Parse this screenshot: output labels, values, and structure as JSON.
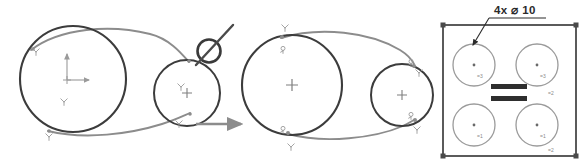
{
  "figure": {
    "background_color": "#ffffff",
    "width": 586,
    "height": 166
  },
  "colors": {
    "circle_stroke": "#3c3c3c",
    "belt_stroke": "#8c8c8c",
    "glyph": "#9a9a9a",
    "panel_stroke": "#4a4a4a",
    "panel_circle_stroke": "#9b9b9b",
    "bar_fill": "#2e2e2e",
    "dimension_text": "#2b2b2b",
    "arrow": "#8c8c8c",
    "constraint_symbol": "#3a3a3a"
  },
  "left_sketch": {
    "name": "unconstrained-pulley-sketch",
    "big_pulley": {
      "cx": 73,
      "cy": 79,
      "r": 53,
      "center_marker": "origin-axes"
    },
    "small_pulley": {
      "cx": 187,
      "cy": 93,
      "r": 33,
      "center_marker": "plus"
    },
    "origin": {
      "x_axis_label": "X",
      "y_axis_label": "Y",
      "marker": "origin-cross"
    },
    "tangent_glyphs": [
      {
        "x": 36,
        "y": 52,
        "type": "tangent-glyph"
      },
      {
        "x": 48,
        "y": 133,
        "type": "tangent-glyph"
      },
      {
        "x": 180,
        "y": 86,
        "type": "tangent-glyph"
      },
      {
        "x": 178,
        "y": 124,
        "type": "tangent-glyph"
      },
      {
        "x": 64,
        "y": 100,
        "type": "tangent-glyph"
      }
    ],
    "belt_segments": 2
  },
  "constraint_symbol": {
    "name": "tangent-constraint-symbol",
    "description": "circle with diagonal line",
    "cx": 209,
    "cy": 50,
    "r": 12
  },
  "transition_arrow": {
    "name": "transition-arrow",
    "direction": "right",
    "x1": 196,
    "y1": 124,
    "x2": 243,
    "y2": 124
  },
  "right_sketch": {
    "name": "constrained-pulley-sketch",
    "big_pulley": {
      "cx": 292,
      "cy": 85,
      "r": 50,
      "center_marker": "plus"
    },
    "small_pulley": {
      "cx": 402,
      "cy": 95,
      "r": 31,
      "center_marker": "plus"
    },
    "tangent_glyphs": [
      {
        "x": 286,
        "y": 30,
        "type": "tangent-glyph"
      },
      {
        "x": 292,
        "y": 146,
        "type": "tangent-glyph"
      },
      {
        "x": 422,
        "y": 68,
        "type": "tangent-glyph"
      },
      {
        "x": 418,
        "y": 128,
        "type": "tangent-glyph"
      }
    ],
    "coincident_glyphs": [
      {
        "x": 283,
        "y": 48,
        "type": "coincident-glyph"
      },
      {
        "x": 283,
        "y": 133,
        "type": "coincident-glyph"
      },
      {
        "x": 412,
        "y": 67,
        "type": "coincident-glyph"
      },
      {
        "x": 412,
        "y": 118,
        "type": "coincident-glyph"
      }
    ],
    "belt_segments": 2
  },
  "hole_pattern_panel": {
    "name": "hole-pattern-panel",
    "dimension_callout": {
      "text": "4x ⌀ 10",
      "quantity_prefix": "4x",
      "diameter_symbol": "⌀",
      "value": "10",
      "leader_from": {
        "x": 498,
        "y": 22
      },
      "leader_to": {
        "x": 473,
        "y": 44
      }
    },
    "plate": {
      "x": 443,
      "y": 25,
      "width": 133,
      "height": 131
    },
    "holes": [
      {
        "id": "hole-top-left",
        "cx": 474,
        "cy": 65,
        "r": 21,
        "label": "=3"
      },
      {
        "id": "hole-top-right",
        "cx": 537,
        "cy": 65,
        "r": 21,
        "label": "=3"
      },
      {
        "id": "hole-bottom-left",
        "cx": 474,
        "cy": 125,
        "r": 21,
        "label": "=1"
      },
      {
        "id": "hole-bottom-right",
        "cx": 537,
        "cy": 125,
        "r": 21,
        "label": "=1"
      }
    ],
    "extra_labels": [
      {
        "id": "label-right-upper",
        "x": 549,
        "y": 94,
        "text": "=2"
      },
      {
        "id": "label-right-lower",
        "x": 549,
        "y": 152,
        "text": "=2"
      }
    ],
    "equal_bars": [
      {
        "id": "equal-bar-upper",
        "x": 491,
        "y": 84,
        "width": 36,
        "height": 5
      },
      {
        "id": "equal-bar-lower",
        "x": 491,
        "y": 96,
        "width": 36,
        "height": 5
      }
    ],
    "corner_markers": 4
  }
}
